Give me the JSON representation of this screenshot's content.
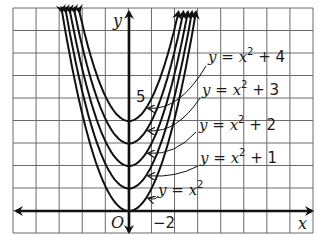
{
  "diagram": {
    "title": "",
    "grid": {
      "cols": 13,
      "rows": 10,
      "unit_px": 22.5,
      "color": "#6a6a6a"
    },
    "axes": {
      "x_label": "x",
      "y_label": "y",
      "origin_label": "O",
      "color": "#111111"
    },
    "tick_labels": {
      "y_tick": "5",
      "x_tick": "−2"
    },
    "curves": [
      {
        "name": "y = x^2",
        "k": 0
      },
      {
        "name": "y = x^2 + 1",
        "k": 1
      },
      {
        "name": "y = x^2 + 2",
        "k": 2
      },
      {
        "name": "y = x^2 + 3",
        "k": 3
      },
      {
        "name": "y = x^2 + 4",
        "k": 4
      }
    ],
    "labels": [
      {
        "y": "y",
        "eq": "=",
        "x": "x",
        "exp": "2",
        "plus": "+ 4"
      },
      {
        "y": "y",
        "eq": "=",
        "x": "x",
        "exp": "2",
        "plus": "+ 3"
      },
      {
        "y": "y",
        "eq": "=",
        "x": "x",
        "exp": "2",
        "plus": "+ 2"
      },
      {
        "y": "y",
        "eq": "=",
        "x": "x",
        "exp": "2",
        "plus": "+ 1"
      },
      {
        "y": "y",
        "eq": "=",
        "x": "x",
        "exp": "2",
        "plus": ""
      }
    ]
  }
}
